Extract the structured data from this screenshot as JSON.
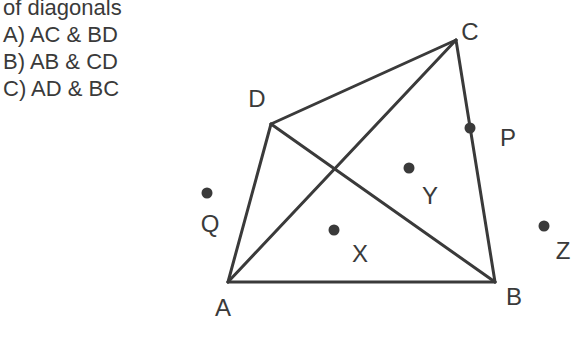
{
  "question": {
    "heading": "of diagonals",
    "options": [
      {
        "label": "A) AC & BD"
      },
      {
        "label": "B) AB & CD"
      },
      {
        "label": "C) AD & BC"
      }
    ]
  },
  "figure": {
    "colors": {
      "stroke": "#3a3a3a",
      "dot": "#3a3a3a"
    },
    "vertices": {
      "A": {
        "label": "A"
      },
      "B": {
        "label": "B"
      },
      "C": {
        "label": "C"
      },
      "D": {
        "label": "D"
      }
    },
    "points": {
      "P": {
        "label": "P"
      },
      "Q": {
        "label": "Q"
      },
      "X": {
        "label": "X"
      },
      "Y": {
        "label": "Y"
      },
      "Z": {
        "label": "Z"
      }
    }
  }
}
